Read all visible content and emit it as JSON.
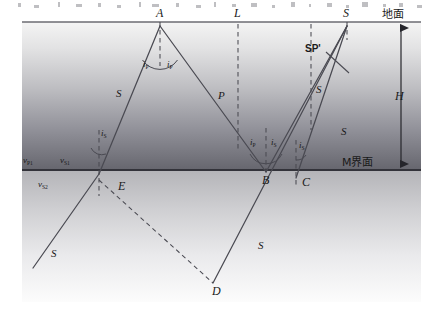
{
  "figure": {
    "type": "seismic-ray-path-diagram",
    "surface_label": "地面",
    "interface_label": "M界面",
    "depth_label": "H"
  },
  "points": {
    "a": "A",
    "b": "B",
    "c": "C",
    "d": "D",
    "e": "E",
    "l": "L",
    "s_top": "S"
  },
  "angles": {
    "a_left": "i",
    "a_left_sub": "P",
    "a_right": "i",
    "a_right_sub": "P",
    "b_left": "i",
    "b_left_sub": "P",
    "b_right": "i",
    "b_right_sub": "S",
    "e_top": "i",
    "e_top_sub": "S",
    "c_right": "i",
    "c_right_sub": "S"
  },
  "velocities": {
    "vp1": "v",
    "vp1_sub": "P1",
    "vs1": "v",
    "vs1_sub": "S1",
    "vs2": "v",
    "vs2_sub": "S2"
  },
  "ray_labels": {
    "s_left_upper": "S",
    "p_mid": "P",
    "s_right_upper": "S",
    "s_right_lower": "S",
    "s_lower_left": "S",
    "s_lower_right": "S",
    "sp_prime": "SP'"
  },
  "colors": {
    "line": "#4a4a52",
    "surface": "#6b6b72",
    "interface": "#3a3a42",
    "layer1_top": "#f2f2f2",
    "layer1_bottom": "#6e6e74",
    "layer2_top": "#b6b6ba",
    "layer2_bottom": "#fbfbfb",
    "text": "#1a1a1a"
  },
  "geometry": {
    "surface_y": 22,
    "interface_y": 170,
    "width": 441,
    "height": 316
  }
}
